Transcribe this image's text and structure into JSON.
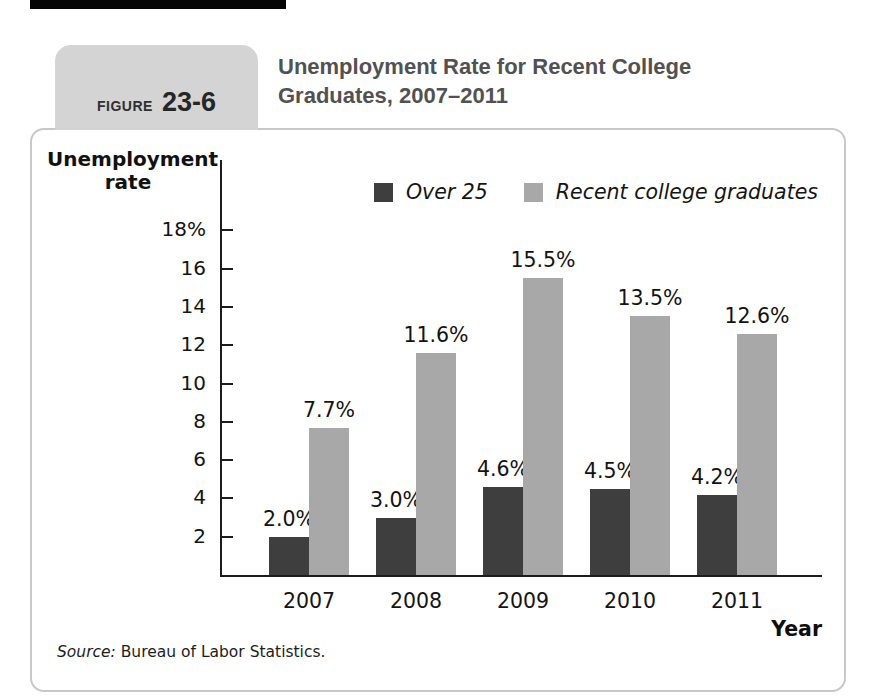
{
  "figure_header": {
    "tab_prefix": "FIGURE",
    "tab_number": "23-6",
    "title_line1": "Unemployment Rate for Recent College",
    "title_line2": "Graduates, 2007–2011"
  },
  "chart_data": {
    "type": "bar",
    "title": "Unemployment Rate for Recent College Graduates, 2007–2011",
    "ylabel": "Unemployment rate",
    "ylabel_lines": [
      "Unemployment",
      "rate"
    ],
    "xlabel": "Year",
    "categories": [
      "2007",
      "2008",
      "2009",
      "2010",
      "2011"
    ],
    "series": [
      {
        "name": "Over 25",
        "color": "#3e3e3e",
        "values": [
          2.0,
          3.0,
          4.6,
          4.5,
          4.2
        ],
        "value_labels": [
          "2.0%",
          "3.0%",
          "4.6%",
          "4.5%",
          "4.2%"
        ]
      },
      {
        "name": "Recent college graduates",
        "color": "#a8a8a8",
        "values": [
          7.7,
          11.6,
          15.5,
          13.5,
          12.6
        ],
        "value_labels": [
          "7.7%",
          "11.6%",
          "15.5%",
          "13.5%",
          "12.6%"
        ]
      }
    ],
    "y_ticks": [
      2,
      4,
      6,
      8,
      10,
      12,
      14,
      16,
      18
    ],
    "y_tick_labels": [
      "2",
      "4",
      "6",
      "8",
      "10",
      "12",
      "14",
      "16",
      "18%"
    ],
    "ylim": [
      0,
      19.5
    ],
    "grid": false,
    "legend_position": "top-right"
  },
  "source_note": {
    "prefix": "Source:",
    "text": " Bureau of Labor Statistics."
  },
  "colors": {
    "bar_dark": "#3e3e3e",
    "bar_gray": "#a8a8a8",
    "tab_background": "#d4d4d4",
    "panel_border": "#c8c8c8",
    "title_text": "#515153",
    "axis_text": "#141414",
    "top_bar": "#050505"
  }
}
